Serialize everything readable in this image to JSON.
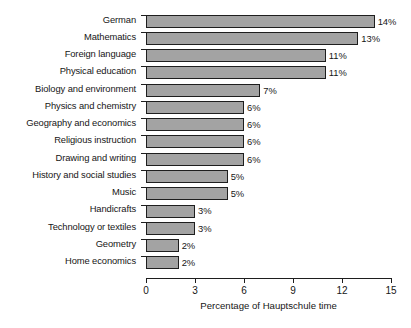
{
  "chart_data": {
    "type": "bar",
    "orientation": "horizontal",
    "title": "",
    "xlabel": "Percentage of Hauptschule time",
    "ylabel": "",
    "xlim": [
      0,
      15
    ],
    "xticks": [
      0,
      3,
      6,
      9,
      12,
      15
    ],
    "xtick_labels": [
      "0",
      "3",
      "6",
      "9",
      "12",
      "15"
    ],
    "grid": false,
    "legend": null,
    "bar_fill_color": "#a3a3a3",
    "bar_edge_color": "#1e1e1e",
    "categories": [
      "German",
      "Mathematics",
      "Foreign language",
      "Physical education",
      "Biology and environment",
      "Physics and chemistry",
      "Geography and economics",
      "Religious instruction",
      "Drawing and writing",
      "History and social studies",
      "Music",
      "Handicrafts",
      "Technology or textiles",
      "Geometry",
      "Home economics"
    ],
    "values": [
      14,
      13,
      11,
      11,
      7,
      6,
      6,
      6,
      6,
      5,
      5,
      3,
      3,
      2,
      2
    ],
    "value_labels": [
      "14%",
      "13%",
      "11%",
      "11%",
      "7%",
      "6%",
      "6%",
      "6%",
      "6%",
      "5%",
      "5%",
      "3%",
      "3%",
      "2%",
      "2%"
    ]
  }
}
